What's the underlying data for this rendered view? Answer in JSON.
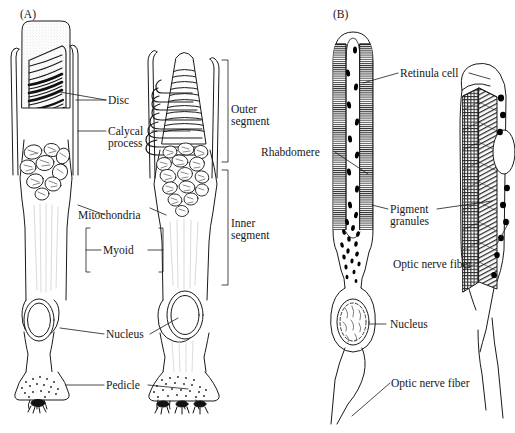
{
  "figure": {
    "line_color": "#1a1a1a",
    "fill_color": "#ffffff",
    "granule_color": "#000000",
    "stipple_color": "#b9b9b9"
  },
  "panels": [
    {
      "id": "A",
      "id_label": "(A)",
      "name": "vertebrate-photoreceptors",
      "cells": [
        "rod",
        "cone"
      ],
      "labels": [
        {
          "key": "disc",
          "text": "Disc"
        },
        {
          "key": "calycal",
          "text": "Calycal\nprocess"
        },
        {
          "key": "mito",
          "text": "Mitochondria"
        },
        {
          "key": "myoid",
          "text": "Myoid"
        },
        {
          "key": "nucleus",
          "text": "Nucleus"
        },
        {
          "key": "pedicle",
          "text": "Pedicle"
        },
        {
          "key": "outer",
          "text": "Outer\nsegment"
        },
        {
          "key": "inner",
          "text": "Inner\nsegment"
        }
      ]
    },
    {
      "id": "B",
      "id_label": "(B)",
      "name": "invertebrate-photoreceptors",
      "cells": [
        "retinula-cell-section",
        "retinula-cell-3d"
      ],
      "labels": [
        {
          "key": "retinula",
          "text": "Retinula cell"
        },
        {
          "key": "rhabdomere",
          "text": "Rhabdomere"
        },
        {
          "key": "pigment",
          "text": "Pigment\ngranules"
        },
        {
          "key": "optic1",
          "text": "Optic nerve fiber"
        },
        {
          "key": "nucleusB",
          "text": "Nucleus"
        },
        {
          "key": "optic2",
          "text": "Optic nerve fiber"
        }
      ]
    }
  ],
  "text": {
    "panelA_id": "(A)",
    "panelB_id": "(B)",
    "disc": "Disc",
    "calycal_line1": "Calycal",
    "calycal_line2": "process",
    "mitochondria": "Mitochondria",
    "myoid": "Myoid",
    "nucleus_a": "Nucleus",
    "pedicle": "Pedicle",
    "outer_line1": "Outer",
    "outer_line2": "segment",
    "inner_line1": "Inner",
    "inner_line2": "segment",
    "retinula_cell": "Retinula cell",
    "rhabdomere": "Rhabdomere",
    "pigment_line1": "Pigment",
    "pigment_line2": "granules",
    "optic_nerve_fiber_1": "Optic nerve fiber",
    "nucleus_b": "Nucleus",
    "optic_nerve_fiber_2": "Optic nerve fiber"
  }
}
